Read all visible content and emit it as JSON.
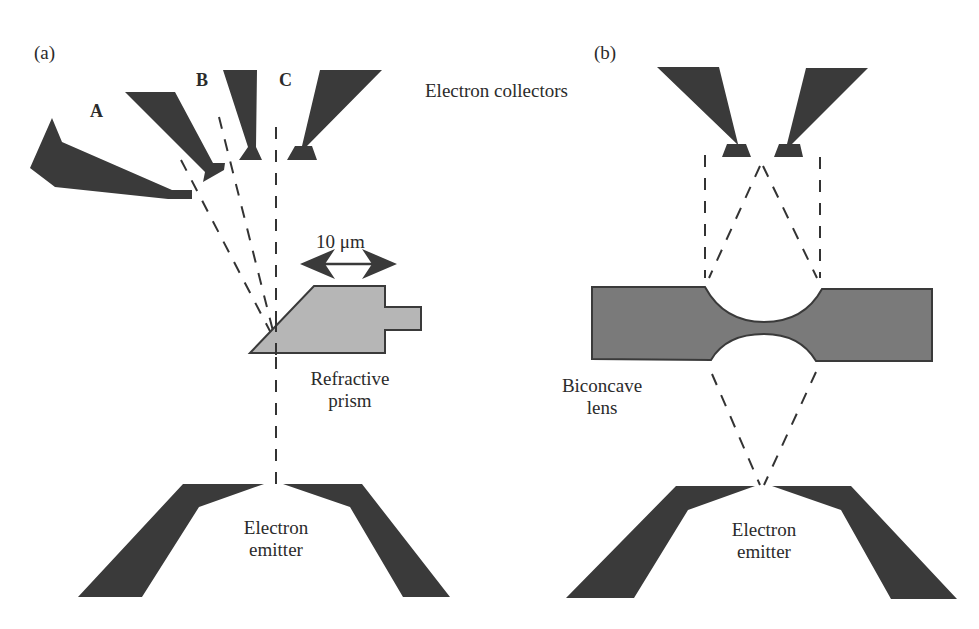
{
  "figure": {
    "panel_a": {
      "label": "(a)",
      "collector_labels": [
        "A",
        "B",
        "C"
      ],
      "collectors_title": "Electron collectors",
      "scale_bar": "10 μm",
      "prism_label_line1": "Refractive",
      "prism_label_line2": "prism",
      "emitter_label_line1": "Electron",
      "emitter_label_line2": "emitter"
    },
    "panel_b": {
      "label": "(b)",
      "lens_label_line1": "Biconcave",
      "lens_label_line2": "lens",
      "emitter_label_line1": "Electron",
      "emitter_label_line2": "emitter"
    },
    "colors": {
      "electrode": "#3a3a3a",
      "prism": "#b6b6b6",
      "lens": "#7a7a7a",
      "background": "#ffffff"
    }
  }
}
